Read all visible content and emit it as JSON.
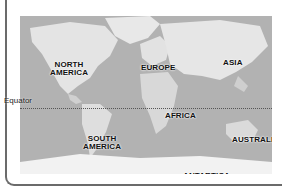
{
  "map": {
    "type": "world-continents",
    "style": "grayscale-relief",
    "continents": [
      {
        "id": "north-america",
        "label": "NORTH\nAMERICA",
        "line1": "NORTH",
        "line2": "AMERICA"
      },
      {
        "id": "europe",
        "label": "EUROPE"
      },
      {
        "id": "asia",
        "label": "ASIA"
      },
      {
        "id": "africa",
        "label": "AFRICA"
      },
      {
        "id": "south-america",
        "label": "SOUTH\nAMERICA",
        "line1": "SOUTH",
        "line2": "AMERICA"
      },
      {
        "id": "australia",
        "label": "AUSTRALIA"
      },
      {
        "id": "antarctica",
        "label": "ANTARTICA"
      }
    ],
    "equator": {
      "label": "Equator"
    }
  },
  "colors": {
    "ocean": "#b4b4b4",
    "land": "#e6e6e6",
    "frame": "#6b6b6b"
  }
}
